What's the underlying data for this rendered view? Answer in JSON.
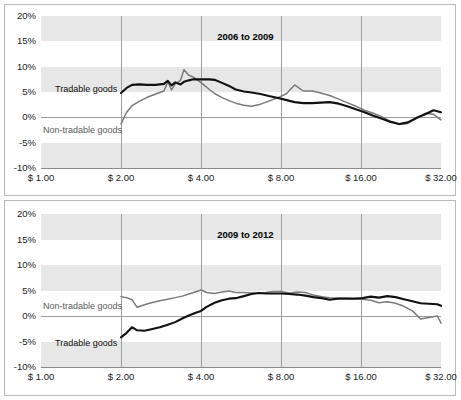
{
  "figure": {
    "background": "#ffffff",
    "border_color": "#b9b9b9"
  },
  "colors": {
    "tradable": "#111111",
    "nontradable": "#7a7a7a",
    "band": "#e7e7e7",
    "gridline": "#9d9d9d",
    "text": "#1a1a1a"
  },
  "panels": {
    "top": {
      "title": "2006 to 2009",
      "label_tradable": "Tradable goods",
      "label_nontradable": "Non-tradable goods"
    },
    "bottom": {
      "title": "2009 to 2012",
      "label_tradable": "Tradable goods",
      "label_nontradable": "Non-tradable goods"
    }
  },
  "axis": {
    "y_ticks": [
      "20%",
      "15%",
      "10%",
      "5%",
      "0%",
      "-5%",
      "-10%"
    ],
    "y_values": [
      20,
      15,
      10,
      5,
      0,
      -5,
      -10
    ],
    "x_ticks": [
      "$ 1.00",
      "$ 2.00",
      "$ 4.00",
      "$ 8.00",
      "$ 16.00",
      "$ 32.00"
    ],
    "x_values": [
      1,
      2,
      4,
      8,
      16,
      32
    ]
  },
  "chart_data": [
    {
      "type": "line",
      "title": "2006 to 2009",
      "xlabel": "",
      "ylabel": "",
      "xscale": "log2",
      "xlim": [
        1,
        32
      ],
      "ylim": [
        -10,
        20
      ],
      "ytick_labels": [
        "20%",
        "15%",
        "10%",
        "5%",
        "0%",
        "-5%",
        "-10%"
      ],
      "xtick_labels": [
        "$ 1.00",
        "$ 2.00",
        "$ 4.00",
        "$ 8.00",
        "$ 16.00",
        "$ 32.00"
      ],
      "grid": "horizontal-banded",
      "legend": "inline-annotation",
      "series": [
        {
          "name": "Tradable goods",
          "color": "#111111",
          "x": [
            2.0,
            2.1,
            2.2,
            2.35,
            2.5,
            2.7,
            2.9,
            3.0,
            3.1,
            3.2,
            3.35,
            3.45,
            3.6,
            3.75,
            3.9,
            4.1,
            4.3,
            4.5,
            4.8,
            5.1,
            5.4,
            5.8,
            6.2,
            6.7,
            7.2,
            7.8,
            8.4,
            9.0,
            9.7,
            10.5,
            11.3,
            12.2,
            13.2,
            14.2,
            15.3,
            16.5,
            17.8,
            19.2,
            20.7,
            22.3,
            24.0,
            25.9,
            27.9,
            30.0,
            32.0
          ],
          "y": [
            4.8,
            5.8,
            6.4,
            6.5,
            6.4,
            6.4,
            6.6,
            7.2,
            6.3,
            6.9,
            6.5,
            7.0,
            7.3,
            7.5,
            7.5,
            7.5,
            7.5,
            7.4,
            6.8,
            6.2,
            5.5,
            5.1,
            4.9,
            4.6,
            4.2,
            3.8,
            3.4,
            3.0,
            2.8,
            2.8,
            2.9,
            3.0,
            2.7,
            2.2,
            1.6,
            1.0,
            0.3,
            -0.3,
            -0.9,
            -1.3,
            -1.0,
            -0.1,
            0.6,
            1.4,
            1.0
          ]
        },
        {
          "name": "Non-tradable goods",
          "color": "#7a7a7a",
          "x": [
            2.0,
            2.1,
            2.2,
            2.35,
            2.5,
            2.7,
            2.9,
            3.0,
            3.1,
            3.2,
            3.35,
            3.45,
            3.6,
            3.75,
            3.9,
            4.1,
            4.3,
            4.5,
            4.8,
            5.1,
            5.4,
            5.8,
            6.2,
            6.7,
            7.2,
            7.8,
            8.4,
            9.0,
            9.7,
            10.5,
            11.3,
            12.2,
            13.2,
            14.2,
            15.3,
            16.5,
            17.8,
            19.2,
            20.7,
            22.3,
            24.0,
            25.9,
            27.9,
            30.0,
            32.0
          ],
          "y": [
            -1.3,
            1.0,
            2.3,
            3.2,
            3.9,
            4.6,
            5.2,
            7.0,
            5.4,
            6.6,
            7.3,
            9.4,
            8.3,
            7.9,
            7.3,
            6.4,
            5.5,
            4.7,
            3.9,
            3.3,
            2.8,
            2.4,
            2.2,
            2.6,
            3.2,
            3.9,
            4.7,
            6.4,
            5.2,
            5.2,
            4.8,
            4.3,
            3.6,
            2.9,
            2.2,
            1.4,
            0.8,
            0.1,
            -0.8,
            -1.4,
            -1.2,
            -0.2,
            0.8,
            0.6,
            -0.5
          ]
        }
      ]
    },
    {
      "type": "line",
      "title": "2009 to 2012",
      "xlabel": "",
      "ylabel": "",
      "xscale": "log2",
      "xlim": [
        1,
        32
      ],
      "ylim": [
        -10,
        20
      ],
      "ytick_labels": [
        "20%",
        "15%",
        "10%",
        "5%",
        "0%",
        "-5%",
        "-10%"
      ],
      "xtick_labels": [
        "$ 1.00",
        "$ 2.00",
        "$ 4.00",
        "$ 8.00",
        "$ 16.00",
        "$ 32.00"
      ],
      "grid": "horizontal-banded",
      "legend": "inline-annotation",
      "series": [
        {
          "name": "Tradable goods",
          "color": "#111111",
          "x": [
            2.0,
            2.1,
            2.2,
            2.3,
            2.45,
            2.6,
            2.8,
            3.0,
            3.2,
            3.4,
            3.6,
            3.8,
            4.0,
            4.2,
            4.5,
            4.8,
            5.1,
            5.4,
            5.8,
            6.2,
            6.6,
            7.0,
            7.5,
            8.0,
            8.6,
            9.2,
            9.9,
            10.6,
            11.4,
            12.2,
            13.1,
            14.1,
            15.1,
            16.2,
            17.4,
            18.7,
            20.1,
            21.6,
            23.2,
            25.0,
            26.8,
            28.8,
            31.0,
            32.0
          ],
          "y": [
            -4.2,
            -3.3,
            -2.2,
            -2.8,
            -2.9,
            -2.6,
            -2.2,
            -1.7,
            -1.2,
            -0.5,
            0.1,
            0.6,
            1.0,
            1.8,
            2.6,
            3.1,
            3.4,
            3.5,
            3.9,
            4.3,
            4.5,
            4.4,
            4.4,
            4.4,
            4.3,
            4.2,
            4.0,
            3.7,
            3.5,
            3.2,
            3.4,
            3.4,
            3.4,
            3.5,
            3.8,
            3.6,
            3.9,
            3.7,
            3.3,
            2.9,
            2.5,
            2.4,
            2.3,
            2.0
          ]
        },
        {
          "name": "Non-tradable goods",
          "color": "#7a7a7a",
          "x": [
            2.0,
            2.1,
            2.2,
            2.3,
            2.45,
            2.6,
            2.8,
            3.0,
            3.2,
            3.4,
            3.6,
            3.8,
            4.0,
            4.2,
            4.5,
            4.8,
            5.1,
            5.4,
            5.8,
            6.2,
            6.6,
            7.0,
            7.5,
            8.0,
            8.6,
            9.2,
            9.9,
            10.6,
            11.4,
            12.2,
            13.1,
            14.1,
            15.1,
            16.2,
            17.4,
            18.7,
            20.1,
            21.6,
            23.2,
            25.0,
            26.8,
            28.8,
            31.0,
            32.0
          ],
          "y": [
            3.8,
            3.6,
            3.2,
            1.7,
            2.2,
            2.6,
            3.0,
            3.3,
            3.6,
            3.9,
            4.3,
            4.7,
            5.1,
            4.6,
            4.4,
            4.7,
            4.9,
            4.6,
            4.6,
            4.5,
            4.5,
            4.6,
            4.8,
            4.8,
            4.5,
            4.7,
            4.6,
            4.1,
            3.8,
            3.6,
            3.5,
            3.5,
            3.4,
            3.3,
            3.1,
            2.6,
            2.8,
            2.5,
            1.9,
            1.0,
            -0.6,
            -0.3,
            0.0,
            -1.4
          ]
        }
      ]
    }
  ]
}
